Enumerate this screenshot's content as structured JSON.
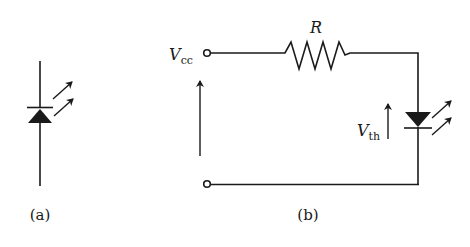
{
  "figure": {
    "panels": [
      {
        "id": "a",
        "caption": "(a)",
        "description": "LED schematic symbol"
      },
      {
        "id": "b",
        "caption": "(b)",
        "description": "LED driven from supply through series resistor"
      }
    ],
    "labels": {
      "resistor": "R",
      "supply_main": "V",
      "supply_sub": "cc",
      "threshold_main": "V",
      "threshold_sub": "th"
    },
    "colors": {
      "stroke": "#1a1a1a",
      "background": "#ffffff"
    }
  }
}
